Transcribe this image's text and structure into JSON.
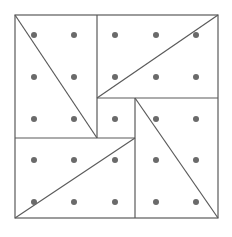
{
  "diagram": {
    "title": "",
    "grid": {
      "rows": 5,
      "cols": 5
    },
    "colors": {
      "line": "#5a5a5a",
      "dot": "#6a6a6a",
      "background": "#ffffff"
    },
    "regions": [
      {
        "name": "top-left-rectangle",
        "diagonal": "top-left to bottom-right"
      },
      {
        "name": "top-right-rectangle",
        "diagonal": "bottom-left to top-right"
      },
      {
        "name": "bottom-right-rectangle",
        "diagonal": "top-left to bottom-right"
      },
      {
        "name": "bottom-left-rectangle",
        "diagonal": "bottom-left to top-right"
      },
      {
        "name": "center-square",
        "diagonal": "none"
      }
    ]
  }
}
